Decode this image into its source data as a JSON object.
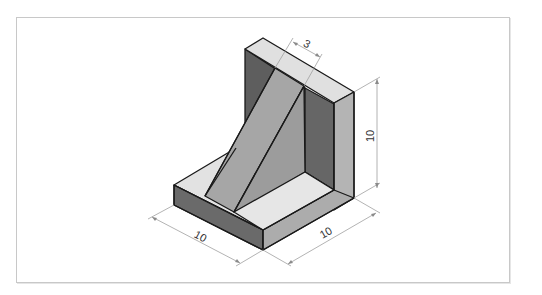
{
  "drawing": {
    "title": "Isometric view of L-bracket with triangular rib",
    "colors": {
      "background": "#ffffff",
      "frame_border": "#c8c8c8",
      "outline": "#1a1a1a",
      "top_face": "#e2e2e2",
      "light_face": "#c4c4c4",
      "mid_face": "#a8a8a8",
      "dark_face": "#6e6e6e",
      "dimension_line": "#a0a0a0",
      "dimension_text": "#333333"
    },
    "dimensions": {
      "rib_thickness": "3",
      "height": "10",
      "depth_left": "10",
      "width_right": "10"
    }
  }
}
